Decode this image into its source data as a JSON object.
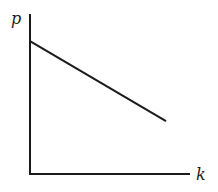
{
  "chart_data": {
    "type": "line",
    "title": "",
    "xlabel": "k",
    "ylabel": "p",
    "grid": false,
    "legend": null,
    "ticks": {
      "x": [],
      "y": []
    },
    "series": [
      {
        "name": "p(k)",
        "points": [
          {
            "x": 0.0,
            "y": 0.83
          },
          {
            "x": 0.85,
            "y": 0.33
          }
        ],
        "color": "#1a1a1a",
        "style": "solid"
      }
    ],
    "xlim": [
      0,
      1
    ],
    "ylim": [
      0,
      1
    ],
    "note": "Schematic diagram, no numeric tick labels; values normalized to axis extents."
  },
  "labels": {
    "x_axis": "k",
    "y_axis": "p"
  },
  "colors": {
    "axis": "#1a1a1a",
    "line": "#1a1a1a",
    "background": "#ffffff"
  }
}
